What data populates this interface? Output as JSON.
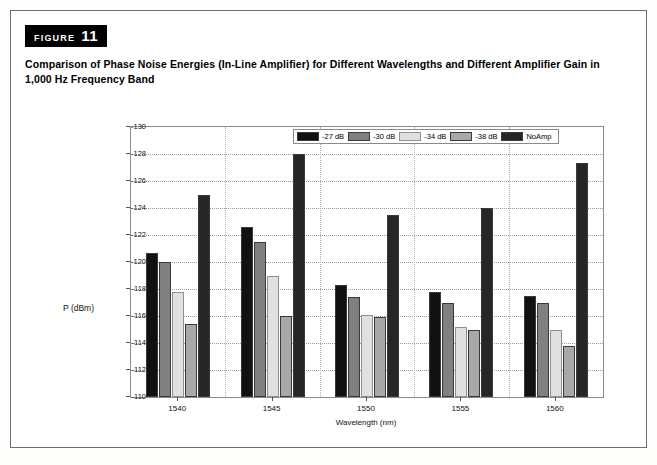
{
  "figure": {
    "tag_word": "FIGURE",
    "tag_number": "11",
    "caption": "Comparison of Phase Noise Energies (In-Line Amplifier) for Different Wavelengths and Different Amplifier Gain in 1,000 Hz Frequency Band"
  },
  "colors": {
    "series_27": "#111111",
    "series_30": "#808080",
    "series_34": "#e0e0e0",
    "series_38": "#a8a8a8",
    "series_noamp": "#262626",
    "grid": "#9a9a9a",
    "axis": "#8c8c8c",
    "frame": "#6e6e6e",
    "text": "#000000"
  },
  "chart_data": {
    "type": "bar",
    "title": "",
    "xlabel": "Wavelength (nm)",
    "ylabel": "P (dBm)",
    "categories": [
      "1540",
      "1545",
      "1550",
      "1555",
      "1560"
    ],
    "ylim": [
      -110,
      -130
    ],
    "yticks": [
      "-130",
      "-128",
      "-126",
      "-124",
      "-122",
      "-120",
      "-118",
      "-116",
      "-114",
      "-112",
      "-110"
    ],
    "ytick_values": [
      -130,
      -128,
      -126,
      -124,
      -122,
      -120,
      -118,
      -116,
      -114,
      -112,
      -110
    ],
    "y_inverted": true,
    "grid": true,
    "legend_position": "top-right",
    "series": [
      {
        "name": "-27 dB",
        "color": "#111111",
        "values": [
          -120.7,
          -122.6,
          -118.3,
          -117.8,
          -117.5
        ]
      },
      {
        "name": "-30 dB",
        "color": "#808080",
        "values": [
          -120.0,
          -121.5,
          -117.4,
          -117.0,
          -117.0
        ]
      },
      {
        "name": "-34 dB",
        "color": "#e0e0e0",
        "values": [
          -117.8,
          -119.0,
          -116.1,
          -115.2,
          -115.0
        ]
      },
      {
        "name": "-38 dB",
        "color": "#a8a8a8",
        "values": [
          -115.4,
          -116.0,
          -115.9,
          -115.0,
          -113.8
        ]
      },
      {
        "name": "NoAmp",
        "color": "#262626",
        "values": [
          -125.0,
          -128.0,
          -123.5,
          -124.0,
          -127.3
        ]
      }
    ]
  }
}
